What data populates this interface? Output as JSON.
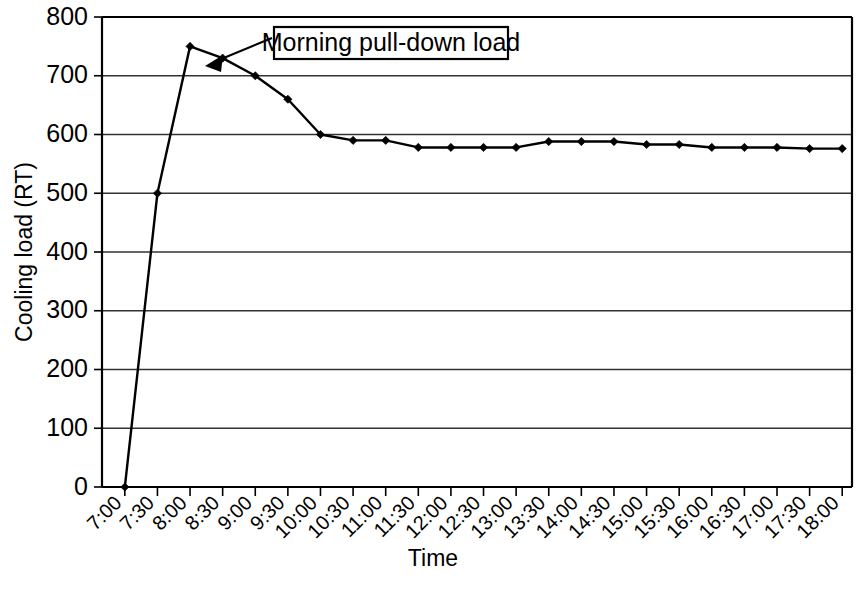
{
  "chart_data": {
    "type": "line",
    "title": "",
    "xlabel": "Time",
    "ylabel": "Cooling load (RT)",
    "ylim": [
      0,
      800
    ],
    "yticks": [
      0,
      100,
      200,
      300,
      400,
      500,
      600,
      700,
      800
    ],
    "ytick_labels": [
      "0",
      "100",
      "200",
      "300",
      "400",
      "500",
      "600",
      "700",
      "800"
    ],
    "grid": true,
    "legend": "none",
    "categories": [
      "7:00",
      "7:30",
      "8:00",
      "8:30",
      "9:00",
      "9:30",
      "10:00",
      "10:30",
      "11:00",
      "11:30",
      "12:00",
      "12:30",
      "13:00",
      "13:30",
      "14:00",
      "14:30",
      "15:00",
      "15:30",
      "16:00",
      "16:30",
      "17:00",
      "17:30",
      "18:00"
    ],
    "series": [
      {
        "name": "Cooling load",
        "values": [
          0,
          500,
          750,
          730,
          700,
          660,
          600,
          590,
          590,
          578,
          578,
          578,
          578,
          588,
          588,
          588,
          583,
          583,
          578,
          578,
          578,
          576,
          576
        ]
      }
    ],
    "annotations": [
      {
        "text": "Morning pull-down load",
        "points_to_category": "8:30",
        "points_to_value": 730
      }
    ],
    "colors": {
      "line": "#000000",
      "marker": "#000000",
      "grid": "#333333",
      "axis": "#000000",
      "background": "#ffffff"
    }
  }
}
